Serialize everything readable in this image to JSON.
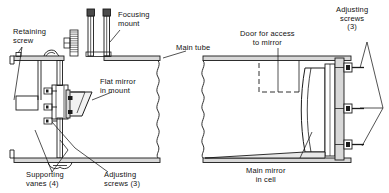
{
  "figure": {
    "view_left": "Flat mirror / focusing mount end",
    "view_right": "Main mirror cell end",
    "line_color": "#1a1a1a",
    "fill_color": "#d8d8d8",
    "background": "#ffffff"
  },
  "labels": {
    "retaining_screw": "Retaining\nscrew",
    "focusing_mount": "Focusing\nmount",
    "main_tube": "Main tube",
    "flat_mirror": "Flat mirror\nin mount",
    "supporting_vanes": "Supporting\nvanes (4)",
    "adjusting_screws_left": "Adjusting\nscrews (3)",
    "door_access": "Door for access\nto mirror",
    "adjusting_screws_right": "Adjusting\nscrews\n(3)",
    "main_mirror": "Main mirror\nin cell"
  },
  "parts": {
    "focus_tube_count": 2,
    "adjusting_screw_count_left": 3,
    "adjusting_screw_count_right": 3,
    "vane_count": 4,
    "break_line_style": "wavy"
  }
}
